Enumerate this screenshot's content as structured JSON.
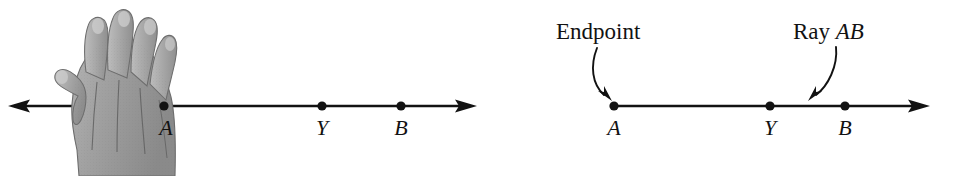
{
  "figure": {
    "background_color": "#ffffff",
    "ink_color": "#121212",
    "hand_color": "#9a9a9a",
    "left_diagram": {
      "name": "line-with-hand",
      "description": "A horizontal line with a left arrowhead, a hand covering the left portion, and points A, Y, B",
      "line_y": 106,
      "arrow_left_x": 8,
      "arrow_right_x": 477,
      "points": [
        {
          "label": "A",
          "x": 164,
          "label_x": 166
        },
        {
          "label": "Y",
          "x": 322,
          "label_x": 322
        },
        {
          "label": "B",
          "x": 401,
          "label_x": 401
        }
      ],
      "hand": {
        "name": "hand-illustration",
        "x": 55,
        "y": 8,
        "width": 122,
        "height": 168
      }
    },
    "right_diagram": {
      "name": "ray-ab-labeled",
      "description": "A ray starting at endpoint A passing through Y and B with a right arrowhead",
      "line_y": 106,
      "arrow_right_x": 930,
      "points": [
        {
          "label": "A",
          "x": 614,
          "label_x": 614
        },
        {
          "label": "Y",
          "x": 770,
          "label_x": 770
        },
        {
          "label": "B",
          "x": 845,
          "label_x": 845
        }
      ],
      "callouts": [
        {
          "name": "endpoint-callout",
          "text": "Endpoint",
          "italic_part": "",
          "text_x": 556,
          "text_baseline_y": 40,
          "arrow_from": [
            597,
            48
          ],
          "arrow_to": [
            612,
            100
          ]
        },
        {
          "name": "ray-ab-callout",
          "text": "Ray ",
          "italic_part": "AB",
          "text_x": 793,
          "text_baseline_y": 40,
          "arrow_from": [
            836,
            48
          ],
          "arrow_to": [
            810,
            100
          ]
        }
      ]
    },
    "point_labels": {
      "a": "A",
      "y": "Y",
      "b": "B"
    }
  }
}
